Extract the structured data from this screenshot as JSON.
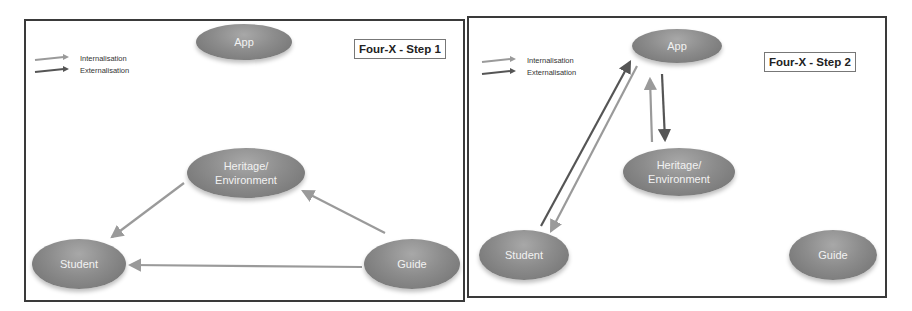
{
  "legend": {
    "internalisation": "Internalisation",
    "externalisation": "Externalisation",
    "internalisation_color": "#9a9a9a",
    "externalisation_color": "#555555"
  },
  "panels": [
    {
      "title": "Four-X - Step 1",
      "nodes": {
        "app": "App",
        "heritage_line1": "Heritage/",
        "heritage_line2": "Environment",
        "student": "Student",
        "guide": "Guide"
      },
      "arrows": [
        {
          "from": "Heritage/Environment",
          "to": "Student",
          "type": "internalisation"
        },
        {
          "from": "Guide",
          "to": "Heritage/Environment",
          "type": "internalisation"
        },
        {
          "from": "Guide",
          "to": "Student",
          "type": "internalisation"
        }
      ]
    },
    {
      "title": "Four-X - Step 2",
      "nodes": {
        "app": "App",
        "heritage_line1": "Heritage/",
        "heritage_line2": "Environment",
        "student": "Student",
        "guide": "Guide"
      },
      "arrows": [
        {
          "from": "Student",
          "to": "App",
          "type": "externalisation"
        },
        {
          "from": "App",
          "to": "Student",
          "type": "internalisation"
        },
        {
          "from": "Heritage/Environment",
          "to": "App",
          "type": "internalisation"
        },
        {
          "from": "App",
          "to": "Heritage/Environment",
          "type": "externalisation"
        }
      ]
    }
  ]
}
